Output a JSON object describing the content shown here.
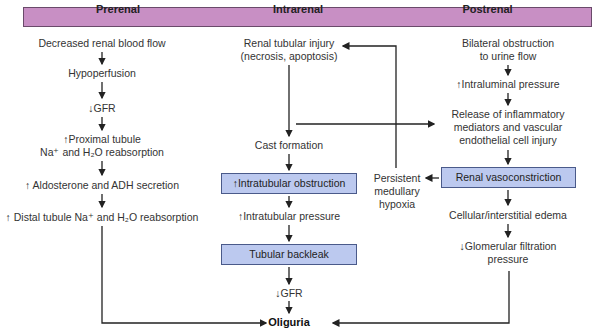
{
  "headers": {
    "prerenal": "Prerenal",
    "intrarenal": "Intrarenal",
    "postrenal": "Postrenal"
  },
  "prerenal": {
    "step1": "Decreased renal blood flow",
    "step2": "Hypoperfusion",
    "step3": "↓GFR",
    "step4a": "↑Proximal tubule",
    "step4b": "Na⁺ and H₂O reabsorption",
    "step5": "↑ Aldosterone and ADH secretion",
    "step6": "↑ Distal tubule Na⁺ and H₂O reabsorption"
  },
  "intrarenal": {
    "step1a": "Renal tubular injury",
    "step1b": "(necrosis, apoptosis)",
    "step2": "Cast formation",
    "step3": "↑Intratubular obstruction",
    "step4": "↑Intratubular pressure",
    "step5": "Tubular backleak",
    "step6": "↓GFR"
  },
  "postrenal": {
    "step1a": "Bilateral obstruction",
    "step1b": "to urine flow",
    "step2": "↑Intraluminal pressure",
    "step3a": "Release of inflammatory",
    "step3b": "mediators and vascular",
    "step3c": "endothelial cell injury",
    "step4": "Renal vasoconstriction",
    "step5": "Cellular/interstitial edema",
    "step6a": "↓Glomerular filtration",
    "step6b": "pressure"
  },
  "hypoxia": {
    "line1": "Persistent",
    "line2": "medullary",
    "line3": "hypoxia"
  },
  "outcome": "Oliguria",
  "colors": {
    "header": "#c88fc4",
    "box": "#bcc9ef",
    "line": "#222222"
  }
}
